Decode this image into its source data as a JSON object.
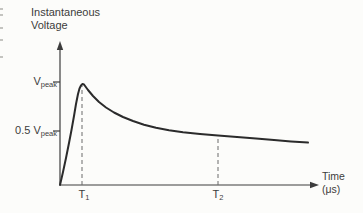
{
  "page_edge_marks": [
    8,
    14,
    27,
    39,
    56
  ],
  "chart_data": {
    "type": "line",
    "ylabel_lines": [
      "Instantaneous",
      "Voltage"
    ],
    "xlabel_lines": [
      "Time",
      "(μs)"
    ],
    "y_ticks": [
      {
        "main": "V",
        "sub": "peak",
        "value": 1.0
      },
      {
        "main": "0.5 V",
        "sub": "peak",
        "value": 0.5
      }
    ],
    "x_ticks": [
      {
        "main": "T",
        "sub": "1",
        "meaning": "time of peak voltage"
      },
      {
        "main": "T",
        "sub": "2",
        "meaning": "time at half of peak voltage"
      }
    ],
    "series": [
      {
        "name": "instantaneous voltage",
        "x_unit": "μs",
        "points_normalized": [
          {
            "t": "0",
            "v": 0.0
          },
          {
            "t": "T1",
            "v": 1.0
          },
          {
            "t": "T2",
            "v": 0.5
          }
        ],
        "shape": "fast near-linear rise from zero to peak at T1, then slow gradual decay crossing half of peak at T2"
      }
    ],
    "grid": false,
    "legend": false,
    "colors": {
      "curve": "#2b2b2b",
      "axis": "#3c3c3c",
      "dashed": "#6a6a6a",
      "text": "#3c3c3c",
      "background": "#fcfcfa"
    },
    "layout_px": {
      "origin": [
        60,
        185
      ],
      "y_axis_top": 42,
      "x_axis_right": 318,
      "tick_len": 7,
      "y_tick_positions": [
        82,
        131
      ],
      "dashed_lines": [
        {
          "x": 82,
          "top": 86
        },
        {
          "x": 218,
          "top": 135
        }
      ],
      "curve_points": [
        [
          60,
          185
        ],
        [
          63,
          172
        ],
        [
          66,
          158
        ],
        [
          69,
          143
        ],
        [
          71.5,
          130
        ],
        [
          74,
          116
        ],
        [
          76,
          104
        ],
        [
          78,
          94
        ],
        [
          79.5,
          88.5
        ],
        [
          81,
          85.5
        ],
        [
          82.5,
          84
        ],
        [
          84,
          84.5
        ],
        [
          88,
          90
        ],
        [
          93,
          96
        ],
        [
          99,
          102
        ],
        [
          106,
          107.5
        ],
        [
          114,
          112.5
        ],
        [
          123,
          117
        ],
        [
          133,
          121
        ],
        [
          144,
          124.7
        ],
        [
          156,
          127.8
        ],
        [
          169,
          130.3
        ],
        [
          183,
          132.3
        ],
        [
          200,
          134
        ],
        [
          218,
          135.4
        ],
        [
          237,
          137
        ],
        [
          256,
          138.6
        ],
        [
          274,
          140
        ],
        [
          291,
          141.4
        ],
        [
          308,
          142.6
        ]
      ]
    }
  }
}
